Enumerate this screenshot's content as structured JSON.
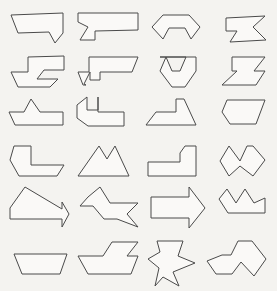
{
  "page": {
    "title": "Polygon Shape Grid",
    "background_color": "#f4f3f0",
    "shape_fill_color": "#faf9f7",
    "shape_stroke_color": "#4a4a4a",
    "stroke_width": 1,
    "width": 277,
    "height": 291,
    "columns": 4,
    "rows": 6,
    "total_shapes": 24
  },
  "chart_data": {
    "type": "scatter",
    "title": "Polygon Shape Grid",
    "xlabel": "",
    "ylabel": "",
    "grid": false,
    "legend": null,
    "categories": [
      "column-1",
      "column-2",
      "column-3",
      "column-4"
    ],
    "values": [
      6,
      6,
      6,
      6
    ]
  },
  "shapes": [
    {
      "id": "shape-r1c1",
      "row": 1,
      "col": 1,
      "name": "flag-arrow-right",
      "points": "11,15 63,13 63,33 55,43 49,32 18,33"
    },
    {
      "id": "shape-r1c2",
      "row": 1,
      "col": 2,
      "name": "stepped-banner-left-notch",
      "points": "78,13 138,13 138,30 95,31 95,40 80,40 88,27 78,22"
    },
    {
      "id": "shape-r1c3",
      "row": 1,
      "col": 3,
      "name": "arch-bracket-notch",
      "points": "152,27 163,15 189,15 200,27 191,39 185,28 169,28 163,39"
    },
    {
      "id": "shape-r1c4",
      "row": 1,
      "col": 4,
      "name": "lightning-zigzag-block",
      "points": "226,18 265,16 253,27 266,40 230,42 237,31 226,31"
    },
    {
      "id": "shape-r2c1",
      "row": 2,
      "col": 1,
      "name": "s-curve-stepped-band",
      "points": "28,57 64,56 64,70 44,70 37,79 58,79 50,87 18,87 11,72 28,72"
    },
    {
      "id": "shape-r2c2",
      "row": 2,
      "col": 2,
      "name": "double-step-wide-band",
      "points": "89,57 138,57 132,72 100,72 100,80 90,80 90,72 84,84 86,85 83,85 78,72 89,72"
    },
    {
      "id": "shape-r2c3",
      "row": 2,
      "col": 3,
      "name": "v-notch-chevron-cup",
      "points": "160,57 196,57 196,71 185,87 172,87 160,71 166,57 172,71 180,71 186,57"
    },
    {
      "id": "shape-r2c4",
      "row": 2,
      "col": 4,
      "name": "z-flag-right",
      "points": "232,57 265,57 254,71 265,71 256,85 222,85 237,71 232,71"
    },
    {
      "id": "shape-r3c1",
      "row": 3,
      "col": 1,
      "name": "crown-peak-boat",
      "points": "31,99 40,112 63,112 63,125 15,125 9,112 24,112"
    },
    {
      "id": "shape-r3c2",
      "row": 3,
      "col": 2,
      "name": "c-hook-left-open",
      "points": "98,97 98,110 87,110 87,97 77,105 77,118 88,126 124,126 124,112 98,112"
    },
    {
      "id": "shape-r3c3",
      "row": 3,
      "col": 3,
      "name": "wedge-sail-boat",
      "points": "184,99 196,125 146,125 156,112 176,112 176,99"
    },
    {
      "id": "shape-r3c4",
      "row": 3,
      "col": 4,
      "name": "slanted-hexagon-block",
      "points": "227,100 265,100 256,124 230,124 222,112"
    },
    {
      "id": "shape-r4c1",
      "row": 4,
      "col": 1,
      "name": "l-bend-boat",
      "points": "14,146 31,146 31,165 64,165 57,176 19,176 10,160"
    },
    {
      "id": "shape-r4c2",
      "row": 4,
      "col": 2,
      "name": "double-mountain-peak",
      "points": "99,146 107,159 115,146 129,176 78,176"
    },
    {
      "id": "shape-r4c3",
      "row": 4,
      "col": 3,
      "name": "arrow-step-right",
      "points": "185,146 196,146 196,176 148,176 148,162 180,162 180,153"
    },
    {
      "id": "shape-r4c4",
      "row": 4,
      "col": 4,
      "name": "bat-wing-notch",
      "points": "229,146 240,161 247,146 253,146 265,160 253,176 240,166 229,176 220,161"
    },
    {
      "id": "shape-r5c1",
      "row": 5,
      "col": 1,
      "name": "big-arrow-right-triangle",
      "points": "25,187 62,209 62,202 69,214 62,227 62,219 10,219 10,208"
    },
    {
      "id": "shape-r5c2",
      "row": 5,
      "col": 2,
      "name": "star-arrow-right",
      "points": "100,187 110,203 138,203 127,214 138,227 117,219 104,219 93,206 80,206 88,197"
    },
    {
      "id": "shape-r5c3",
      "row": 5,
      "col": 3,
      "name": "block-arrow-right",
      "points": "189,187 205,208 189,228 189,218 151,218 151,197 189,197"
    },
    {
      "id": "shape-r5c4",
      "row": 5,
      "col": 4,
      "name": "crown-twin-peak-boat",
      "points": "227,189 236,203 245,189 254,203 265,198 265,213 228,213 219,199"
    },
    {
      "id": "shape-r6c1",
      "row": 6,
      "col": 1,
      "name": "trapezoid-boat",
      "points": "14,254 67,254 60,274 22,274"
    },
    {
      "id": "shape-r6c2",
      "row": 6,
      "col": 2,
      "name": "step-deck-boat",
      "points": "112,242 138,242 127,256 138,256 131,274 88,274 78,256 103,256"
    },
    {
      "id": "shape-r6c3",
      "row": 6,
      "col": 3,
      "name": "arrow-fletch-down",
      "points": "157,241 183,241 178,256 195,263 173,272 179,286 163,277 155,286 159,268 148,259 160,252"
    },
    {
      "id": "shape-r6c4",
      "row": 6,
      "col": 4,
      "name": "double-hump-arrow",
      "points": "238,241 252,241 266,259 254,276 241,262 232,274 216,274 207,261 222,255 231,255"
    }
  ]
}
